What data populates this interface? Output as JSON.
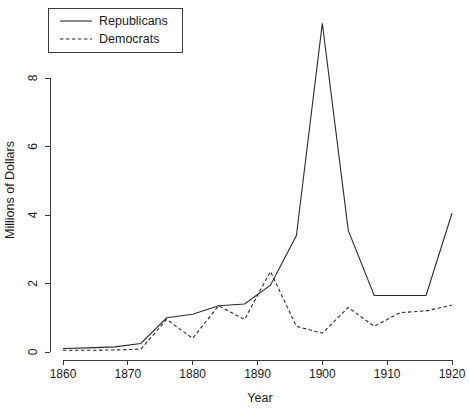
{
  "chart_data": {
    "type": "line",
    "title": "",
    "xlabel": "Year",
    "ylabel": "Millions of Dollars",
    "xlim": [
      1858,
      1922
    ],
    "ylim": [
      -0.35,
      9.8
    ],
    "xticks": [
      1860,
      1870,
      1880,
      1890,
      1900,
      1910,
      1920
    ],
    "yticks": [
      0,
      2,
      4,
      6,
      8
    ],
    "grid": false,
    "legend_position": "top-left",
    "x": [
      1860,
      1864,
      1868,
      1872,
      1876,
      1880,
      1884,
      1888,
      1892,
      1896,
      1900,
      1904,
      1908,
      1912,
      1916,
      1920
    ],
    "series": [
      {
        "name": "Republicans",
        "style": "solid",
        "values": [
          0.1,
          0.12,
          0.15,
          0.25,
          1.0,
          1.1,
          1.35,
          1.4,
          1.95,
          3.4,
          9.6,
          3.55,
          1.65,
          1.65,
          1.65,
          4.05
        ]
      },
      {
        "name": "Democrats",
        "style": "dashed",
        "values": [
          0.05,
          0.05,
          0.06,
          0.08,
          0.95,
          0.4,
          1.35,
          0.95,
          2.35,
          0.75,
          0.55,
          1.3,
          0.75,
          1.15,
          1.2,
          1.37
        ]
      }
    ]
  },
  "legend": {
    "entries": [
      {
        "label": "Republicans",
        "style": "solid"
      },
      {
        "label": "Democrats",
        "style": "dashed"
      }
    ]
  },
  "axes": {
    "x_title": "Year",
    "y_title": "Millions of Dollars",
    "x_tick_labels": [
      "1860",
      "1870",
      "1880",
      "1890",
      "1900",
      "1910",
      "1920"
    ],
    "y_tick_labels": [
      "0",
      "2",
      "4",
      "6",
      "8"
    ]
  },
  "colors": {
    "background": "#ffffff",
    "axis": "#3a3a3a",
    "line": "#2b2b2b",
    "text": "#1a1a1a"
  }
}
